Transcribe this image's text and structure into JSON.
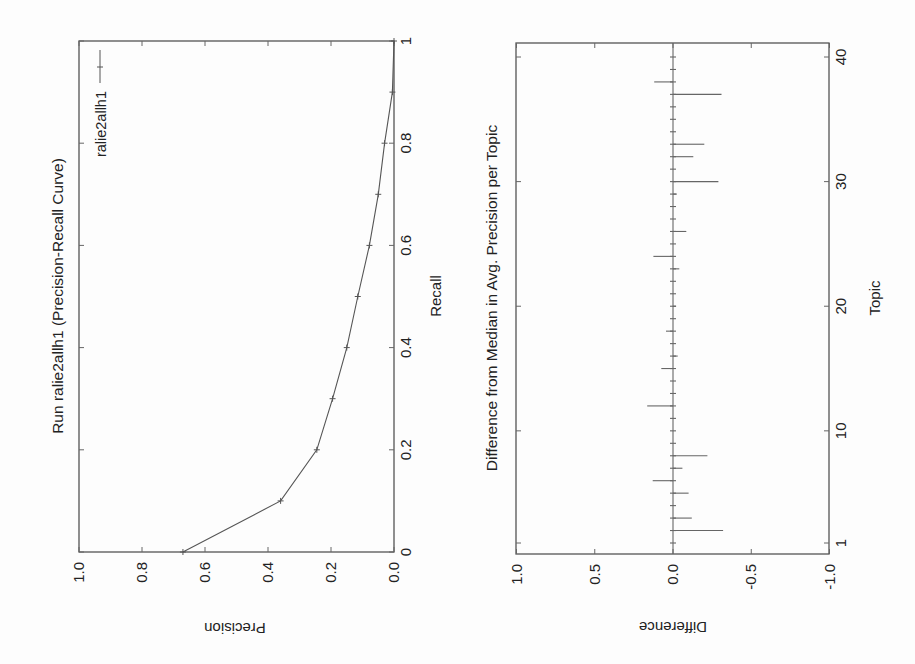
{
  "page": {
    "orientation": "rotated 90 degrees clockwise",
    "background": "#fdfdfd",
    "ink": "#555555"
  },
  "chart_data": [
    {
      "type": "line",
      "title": "Run ralie2allh1 (Precision-Recall Curve)",
      "xlabel": "Recall",
      "ylabel": "Precision",
      "xlim": [
        0,
        1
      ],
      "ylim": [
        0.0,
        1.0
      ],
      "x_ticks": [
        "0",
        "0.2",
        "0.4",
        "0.6",
        "0.8",
        "1"
      ],
      "y_ticks": [
        "0.0",
        "0.2",
        "0.4",
        "0.6",
        "0.8",
        "1.0"
      ],
      "legend": {
        "position": "upper right",
        "entries": [
          "ralie2allh1"
        ]
      },
      "grid": false,
      "series": [
        {
          "name": "ralie2allh1",
          "x": [
            0.0,
            0.1,
            0.2,
            0.3,
            0.4,
            0.5,
            0.6,
            0.7,
            0.8,
            0.9,
            1.0
          ],
          "values": [
            0.67,
            0.36,
            0.245,
            0.195,
            0.15,
            0.115,
            0.078,
            0.05,
            0.03,
            0.005,
            0.0
          ]
        }
      ]
    },
    {
      "type": "bar",
      "orientation": "vertical bars (difference per topic)",
      "title": "Difference from Median in Avg. Precision per Topic",
      "xlabel": "Topic",
      "ylabel": "Difference",
      "xlim": [
        1,
        40
      ],
      "ylim": [
        -1.0,
        1.0
      ],
      "x_ticks": [
        "1",
        "10",
        "20",
        "30",
        "40"
      ],
      "y_ticks": [
        "1.0",
        "0.5",
        "0.0",
        "-0.5",
        "-1.0"
      ],
      "grid": false,
      "categories": [
        1,
        2,
        3,
        4,
        5,
        6,
        7,
        8,
        9,
        10,
        11,
        12,
        13,
        14,
        15,
        16,
        17,
        18,
        19,
        20,
        21,
        22,
        23,
        24,
        25,
        26,
        27,
        28,
        29,
        30,
        31,
        32,
        33,
        34,
        35,
        36,
        37,
        38,
        39,
        40
      ],
      "values": [
        0.0,
        -0.32,
        -0.12,
        0.0,
        -0.1,
        0.13,
        -0.06,
        -0.22,
        0.0,
        0.0,
        0.0,
        0.165,
        0.0,
        0.0,
        0.075,
        -0.03,
        0.0,
        0.045,
        0.0,
        -0.02,
        0.0,
        0.0,
        -0.04,
        0.125,
        0.0,
        -0.085,
        0.0,
        0.0,
        -0.025,
        -0.29,
        0.0,
        -0.13,
        -0.2,
        0.0,
        0.0,
        0.0,
        -0.31,
        0.12,
        0.0,
        0.0
      ]
    }
  ]
}
